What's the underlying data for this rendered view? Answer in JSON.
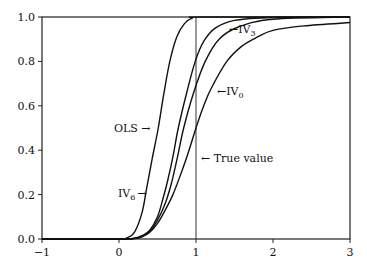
{
  "chart_data": {
    "type": "line",
    "title": "",
    "xlabel": "",
    "ylabel": "",
    "xlim": [
      -1,
      3
    ],
    "ylim": [
      0,
      1.0
    ],
    "grid": false,
    "legend": "none (inline annotations)",
    "x_ticks": [
      -1,
      0,
      1,
      2,
      3
    ],
    "x_tick_labels": [
      "−1",
      "0",
      "1",
      "2",
      "3"
    ],
    "y_ticks": [
      0.0,
      0.2,
      0.4,
      0.6,
      0.8,
      1.0
    ],
    "y_tick_labels": [
      "0.0",
      "0.2",
      "0.4",
      "0.6",
      "0.8",
      "1.0"
    ],
    "reference_line": {
      "x": 1,
      "label": "True value"
    },
    "series": [
      {
        "name": "OLS",
        "label_main": "OLS",
        "label_sub": "",
        "points": [
          [
            -1,
            0.0
          ],
          [
            0.0,
            0.0
          ],
          [
            0.1,
            0.005
          ],
          [
            0.2,
            0.03
          ],
          [
            0.3,
            0.12
          ],
          [
            0.36,
            0.23
          ],
          [
            0.43,
            0.36
          ],
          [
            0.51,
            0.5
          ],
          [
            0.58,
            0.65
          ],
          [
            0.66,
            0.8
          ],
          [
            0.75,
            0.91
          ],
          [
            0.85,
            0.97
          ],
          [
            0.95,
            0.995
          ],
          [
            1.1,
            1.0
          ],
          [
            3,
            1.0
          ]
        ]
      },
      {
        "name": "IV6",
        "label_main": "IV",
        "label_sub": "6",
        "points": [
          [
            -1,
            0.0
          ],
          [
            0.0,
            0.0
          ],
          [
            0.2,
            0.004
          ],
          [
            0.3,
            0.015
          ],
          [
            0.4,
            0.04
          ],
          [
            0.5,
            0.1
          ],
          [
            0.57,
            0.18
          ],
          [
            0.63,
            0.26
          ],
          [
            0.7,
            0.37
          ],
          [
            0.77,
            0.5
          ],
          [
            0.88,
            0.66
          ],
          [
            0.99,
            0.8
          ],
          [
            1.1,
            0.89
          ],
          [
            1.25,
            0.95
          ],
          [
            1.5,
            0.985
          ],
          [
            2.0,
            0.998
          ],
          [
            3,
            1.0
          ]
        ]
      },
      {
        "name": "IV3",
        "label_main": "IV",
        "label_sub": "3",
        "points": [
          [
            -1,
            0.0
          ],
          [
            0.0,
            0.0
          ],
          [
            0.2,
            0.003
          ],
          [
            0.3,
            0.012
          ],
          [
            0.4,
            0.035
          ],
          [
            0.5,
            0.085
          ],
          [
            0.6,
            0.16
          ],
          [
            0.68,
            0.25
          ],
          [
            0.76,
            0.37
          ],
          [
            0.84,
            0.5
          ],
          [
            0.97,
            0.66
          ],
          [
            1.12,
            0.8
          ],
          [
            1.3,
            0.9
          ],
          [
            1.55,
            0.955
          ],
          [
            2.0,
            0.99
          ],
          [
            3,
            1.0
          ]
        ]
      },
      {
        "name": "IV0",
        "label_main": "IV",
        "label_sub": "0",
        "points": [
          [
            -1,
            0.0
          ],
          [
            0.0,
            0.0
          ],
          [
            0.2,
            0.002
          ],
          [
            0.3,
            0.01
          ],
          [
            0.4,
            0.03
          ],
          [
            0.5,
            0.07
          ],
          [
            0.6,
            0.13
          ],
          [
            0.7,
            0.2
          ],
          [
            0.8,
            0.29
          ],
          [
            0.9,
            0.39
          ],
          [
            1.0,
            0.5
          ],
          [
            1.1,
            0.6
          ],
          [
            1.2,
            0.68
          ],
          [
            1.4,
            0.8
          ],
          [
            1.6,
            0.87
          ],
          [
            1.8,
            0.91
          ],
          [
            2.0,
            0.94
          ],
          [
            2.4,
            0.96
          ],
          [
            3.0,
            0.975
          ]
        ]
      }
    ],
    "annotations": [
      {
        "text": "OLS →",
        "target": "OLS"
      },
      {
        "text": "← IV3",
        "target": "IV3"
      },
      {
        "text": "← IV0",
        "target": "IV0"
      },
      {
        "text": "IV6 →",
        "target": "IV6"
      },
      {
        "text": "← True value",
        "target": "reference_line"
      }
    ]
  },
  "labels": {
    "ols": "OLS →",
    "iv3_main": "←IV",
    "iv3_sub": "3",
    "iv0_main": "←IV",
    "iv0_sub": "0",
    "iv6_main": "IV",
    "iv6_sub": "6",
    "iv6_arrow": "→",
    "true_value": "← True value"
  }
}
